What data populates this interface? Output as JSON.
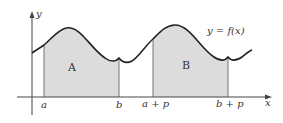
{
  "diagram": {
    "function_label": "y = f(x)",
    "axes": {
      "x_label": "x",
      "y_label": "y"
    },
    "regions": [
      {
        "label": "A",
        "from": "a",
        "to": "b"
      },
      {
        "label": "B",
        "from": "a + p",
        "to": "b + p"
      }
    ],
    "ticks": [
      "a",
      "b",
      "a + p",
      "b + p"
    ],
    "colors": {
      "fill": "#dcdcdc",
      "curve": "#222222",
      "axis": "#444444"
    }
  }
}
